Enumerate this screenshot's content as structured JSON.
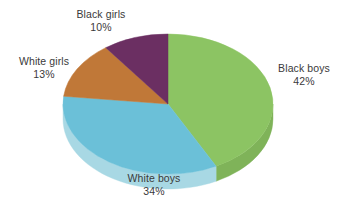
{
  "chart_data": {
    "type": "pie",
    "title": "",
    "subtitle": "",
    "xlabel": "",
    "ylabel": "",
    "legend_position": "none",
    "grid": false,
    "style": "3d-pie",
    "background_color": "#ffffff",
    "label_text_color": "#3a3a3a",
    "start_angle_deg": 0,
    "direction": "clockwise",
    "categories": [
      "Black boys",
      "White boys",
      "White girls",
      "Black girls"
    ],
    "values": [
      42,
      34,
      13,
      10
    ],
    "units": "%",
    "slices": [
      {
        "label": "Black boys",
        "value": 42,
        "value_text": "42%",
        "color": "#8cc463",
        "side_color": "#7fb359"
      },
      {
        "label": "White boys",
        "value": 34,
        "value_text": "34%",
        "color": "#6bc0d8",
        "side_color": "#a8d8e4"
      },
      {
        "label": "White girls",
        "value": 13,
        "value_text": "13%",
        "color": "#c07838",
        "side_color": "#a9682f"
      },
      {
        "label": "Black girls",
        "value": 10,
        "value_text": "10%",
        "color": "#6b2f62",
        "side_color": "#5a2753"
      }
    ]
  },
  "labels": {
    "black_girls": {
      "name": "Black girls",
      "value": "10%"
    },
    "white_girls": {
      "name": "White girls",
      "value": "13%"
    },
    "black_boys": {
      "name": "Black boys",
      "value": "42%"
    },
    "white_boys": {
      "name": "White boys",
      "value": "34%"
    }
  }
}
